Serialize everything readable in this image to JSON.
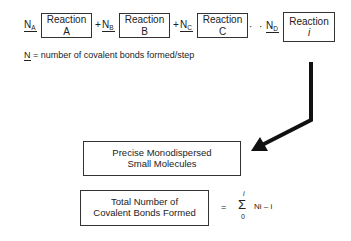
{
  "reactions": [
    {
      "n_label": "N",
      "n_sub": "A",
      "title": "Reaction",
      "letter": "A"
    },
    {
      "n_label": "N",
      "n_sub": "B",
      "title": "Reaction",
      "letter": "B"
    },
    {
      "n_label": "N",
      "n_sub": "C",
      "title": "Reaction",
      "letter": "C"
    },
    {
      "n_label": "N",
      "n_sub": "D",
      "title": "Reaction",
      "letter": "i"
    }
  ],
  "operators": {
    "plus": "+",
    "ellipsis": "· · ·"
  },
  "legend": {
    "symbol": "N",
    "text": " = number of covalent bonds formed/step"
  },
  "product_box": {
    "line1": "Precise Monodispersed",
    "line2": "Small Molecules"
  },
  "total_box": {
    "line1": "Total Number of",
    "line2": "Covalent Bonds Formed"
  },
  "formula": {
    "equals": "=",
    "sigma": "Σ",
    "upper": "i",
    "lower": "0",
    "expr": "Ni – i"
  },
  "colors": {
    "line": "#333333",
    "arrow": "#111111"
  }
}
